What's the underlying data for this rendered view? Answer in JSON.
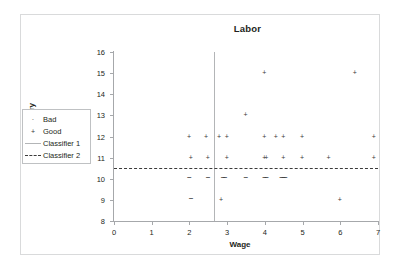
{
  "figure": {
    "title": "Labor",
    "xlabel": "Wage",
    "ylabel": "Statutory"
  },
  "legend": {
    "items": [
      {
        "label": "Bad",
        "marker": "dot-marker"
      },
      {
        "label": "Good",
        "marker": "plus-marker"
      },
      {
        "label": "Classifier 1",
        "marker": "solid-line"
      },
      {
        "label": "Classifier 2",
        "marker": "dashed-line"
      }
    ]
  },
  "axes": {
    "x_ticks": [
      "0",
      "1",
      "2",
      "3",
      "4",
      "5",
      "6",
      "7"
    ],
    "y_ticks": [
      "8",
      "9",
      "10",
      "11",
      "12",
      "13",
      "14",
      "15",
      "16"
    ]
  },
  "chart_data": {
    "type": "scatter",
    "title": "Labor",
    "xlabel": "Wage",
    "ylabel": "Statutory",
    "xlim": [
      0,
      7
    ],
    "ylim": [
      8,
      16
    ],
    "grid": false,
    "legend_position": "outside-left",
    "series": [
      {
        "name": "Good",
        "marker": "plus",
        "color": "#3a3a3a",
        "points": [
          [
            2.0,
            12
          ],
          [
            2.45,
            12
          ],
          [
            2.8,
            12
          ],
          [
            3.0,
            12
          ],
          [
            4.0,
            12
          ],
          [
            4.3,
            12
          ],
          [
            4.5,
            12
          ],
          [
            5.0,
            12
          ],
          [
            6.9,
            12
          ],
          [
            2.05,
            11
          ],
          [
            2.5,
            11
          ],
          [
            3.0,
            11
          ],
          [
            4.0,
            11
          ],
          [
            4.05,
            11
          ],
          [
            4.5,
            11
          ],
          [
            5.0,
            11
          ],
          [
            5.7,
            11
          ],
          [
            6.9,
            11
          ],
          [
            3.5,
            13
          ],
          [
            4.0,
            15
          ],
          [
            6.4,
            15
          ],
          [
            2.85,
            9
          ],
          [
            6.0,
            9
          ]
        ]
      },
      {
        "name": "Bad",
        "marker": "dash",
        "color": "#3a3a3a",
        "points": [
          [
            2.0,
            10
          ],
          [
            2.5,
            10
          ],
          [
            2.9,
            10
          ],
          [
            2.95,
            10
          ],
          [
            3.5,
            10
          ],
          [
            4.0,
            10
          ],
          [
            4.05,
            10
          ],
          [
            4.45,
            10
          ],
          [
            4.5,
            10
          ],
          [
            4.55,
            10
          ],
          [
            2.05,
            9
          ]
        ]
      }
    ],
    "classifiers": [
      {
        "name": "Classifier 1",
        "type": "vertical",
        "value": 2.65,
        "style": "solid",
        "color": "#b3b5b7"
      },
      {
        "name": "Classifier 2",
        "type": "horizontal",
        "value": 10.5,
        "style": "dashed",
        "color": "#3b3b3b"
      }
    ]
  }
}
